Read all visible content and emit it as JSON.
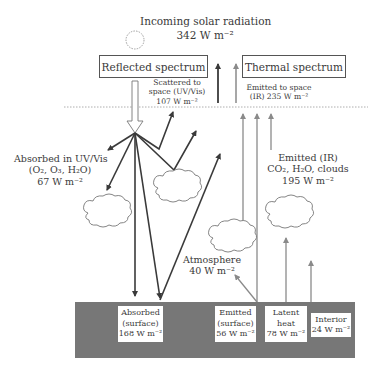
{
  "title": {
    "line1": "Incoming solar radiation",
    "line2": "342 W m⁻²"
  },
  "icons": {
    "sun": "sun-icon",
    "cloud": "cloud-icon"
  },
  "boxes": {
    "reflected": "Reflected spectrum",
    "thermal": "Thermal spectrum"
  },
  "labels": {
    "scattered": {
      "line1": "Scattered to",
      "line2": "space (UV/Vis)",
      "line3": "107 W m⁻²"
    },
    "emitted_space": {
      "line1": "Emitted to space",
      "line2": "(IR) 235 W m⁻²"
    },
    "absorbed_uv": {
      "line1": "Absorbed in UV/Vis",
      "line2": "(O₂, O₃, H₂O)",
      "line3": "67 W m⁻²"
    },
    "emitted_ir": {
      "line1": "Emitted (IR)",
      "line2": "CO₂, H₂O, clouds",
      "line3": "195 W m⁻²"
    },
    "atmosphere": {
      "line1": "Atmosphere",
      "line2": "40 W m⁻²"
    }
  },
  "ground": {
    "absorbed": {
      "line1": "Absorbed",
      "line2": "(surface)",
      "line3": "168 W m⁻²"
    },
    "emitted": {
      "line1": "Emitted",
      "line2": "(surface)",
      "line3": "56 W m⁻²"
    },
    "latent": {
      "line1": "Latent",
      "line2": "heat",
      "line3": "78 W m⁻²"
    },
    "interior": {
      "line1": "Interior",
      "line2": "24 W m⁻²"
    }
  },
  "colors": {
    "dark_arrow": "#3a3a3a",
    "grey_arrow": "#8a8a8a",
    "ground": "#777777",
    "dashed": "#999999"
  }
}
